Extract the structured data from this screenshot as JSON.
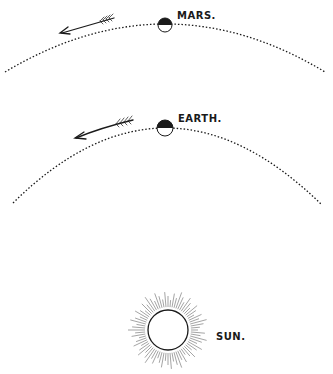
{
  "diagram": {
    "type": "orbital-diagram",
    "colors": {
      "ink": "#1a1a1a",
      "background": "#ffffff",
      "rays": "#666666"
    },
    "bodies": [
      {
        "name": "mars",
        "label": "MARS.",
        "shading": "dark upper half"
      },
      {
        "name": "earth",
        "label": "EARTH.",
        "shading": "dark upper half"
      },
      {
        "name": "sun",
        "label": "SUN.",
        "shading": "open circle with radiating rays"
      }
    ],
    "orbits": [
      {
        "name": "mars-orbit",
        "style": "dotted",
        "direction": "leftward (arrow)"
      },
      {
        "name": "earth-orbit",
        "style": "dotted",
        "direction": "leftward (arrow)"
      }
    ]
  },
  "labels": {
    "mars": "MARS.",
    "earth": "EARTH.",
    "sun": "SUN."
  }
}
